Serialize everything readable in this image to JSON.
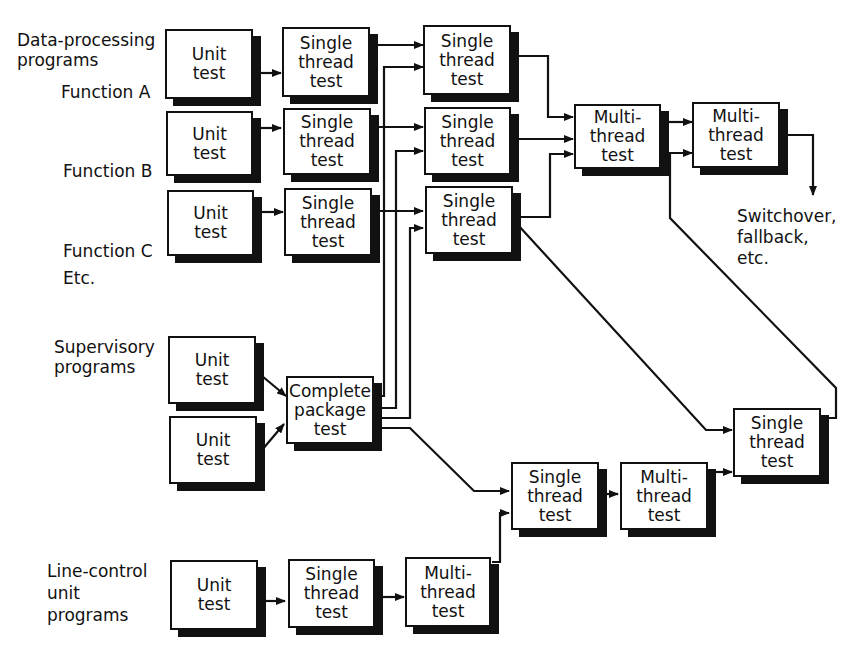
{
  "diagram": {
    "labels": {
      "data_processing": [
        "Data-processing",
        "programs"
      ],
      "function_a": "Function A",
      "function_b": "Function B",
      "function_c": "Function C",
      "etc": "Etc.",
      "supervisory": [
        "Supervisory",
        "programs"
      ],
      "line_control": [
        "Line-control",
        "unit",
        "programs"
      ],
      "switchover": [
        "Switchover,",
        "fallback,",
        "etc."
      ]
    },
    "boxes": {
      "a_unit": [
        "Unit",
        "test"
      ],
      "a_single": [
        "Single",
        "thread",
        "test"
      ],
      "a_single2": [
        "Single",
        "thread",
        "test"
      ],
      "b_unit": [
        "Unit",
        "test"
      ],
      "b_single": [
        "Single",
        "thread",
        "test"
      ],
      "b_single2": [
        "Single",
        "thread",
        "test"
      ],
      "c_unit": [
        "Unit",
        "test"
      ],
      "c_single": [
        "Single",
        "thread",
        "test"
      ],
      "c_single2": [
        "Single",
        "thread",
        "test"
      ],
      "multi1": [
        "Multi-",
        "thread",
        "test"
      ],
      "multi2": [
        "Multi-",
        "thread",
        "test"
      ],
      "sup_unit1": [
        "Unit",
        "test"
      ],
      "sup_unit2": [
        "Unit",
        "test"
      ],
      "complete": [
        "Complete",
        "package",
        "test"
      ],
      "lc_unit": [
        "Unit",
        "test"
      ],
      "lc_single": [
        "Single",
        "thread",
        "test"
      ],
      "lc_multi": [
        "Multi-",
        "thread",
        "test"
      ],
      "low_single": [
        "Single",
        "thread",
        "test"
      ],
      "low_multi": [
        "Multi-",
        "thread",
        "test"
      ],
      "right_single": [
        "Single",
        "thread",
        "test"
      ]
    }
  }
}
